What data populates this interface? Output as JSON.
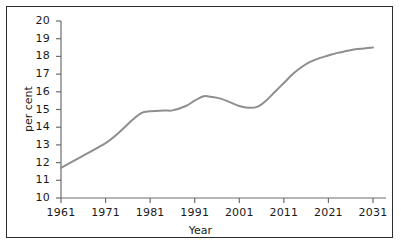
{
  "chart_data": {
    "type": "line",
    "title": "",
    "xlabel": "Year",
    "ylabel": "per cent",
    "xlim": [
      1961,
      2034
    ],
    "ylim": [
      10,
      20
    ],
    "xticks": [
      1961,
      1971,
      1981,
      1991,
      2001,
      2011,
      2021,
      2031
    ],
    "xtick_labels": [
      "1961",
      "1971",
      "1981",
      "1991",
      "2001",
      "2011",
      "2021",
      "2031"
    ],
    "yticks": [
      10,
      11,
      12,
      13,
      14,
      15,
      16,
      17,
      18,
      19,
      20
    ],
    "ytick_labels": [
      "10",
      "11",
      "12",
      "13",
      "14",
      "15",
      "16",
      "17",
      "18",
      "19",
      "20"
    ],
    "grid": false,
    "legend": false,
    "line_color": "#8e8e8e",
    "line_width": 2,
    "series": [
      {
        "name": "per cent",
        "x": [
          1961,
          1966,
          1971,
          1974,
          1977,
          1979,
          1981,
          1984,
          1986,
          1989,
          1991,
          1993,
          1995,
          1997,
          1999,
          2001,
          2003,
          2005,
          2007,
          2009,
          2011,
          2013,
          2015,
          2017,
          2019,
          2021,
          2023,
          2025,
          2027,
          2029,
          2031
        ],
        "values": [
          11.7,
          12.4,
          13.1,
          13.7,
          14.4,
          14.8,
          14.9,
          14.95,
          14.95,
          15.2,
          15.5,
          15.75,
          15.7,
          15.6,
          15.4,
          15.2,
          15.1,
          15.15,
          15.5,
          16.0,
          16.5,
          17.0,
          17.4,
          17.7,
          17.9,
          18.05,
          18.2,
          18.3,
          18.4,
          18.45,
          18.5
        ]
      }
    ]
  },
  "axes": {
    "y_axis_title": "per cent",
    "x_axis_title": "Year"
  }
}
